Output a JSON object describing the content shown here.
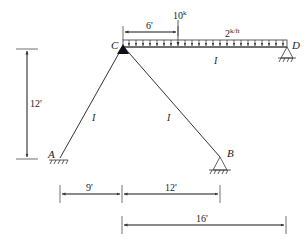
{
  "diagram": {
    "type": "structural-frame",
    "colors": {
      "line": "#333333",
      "text": "#222222",
      "background": "#ffffff"
    },
    "nodes": {
      "A": {
        "label": "A",
        "support": "fixed"
      },
      "B": {
        "label": "B",
        "support": "pin"
      },
      "C": {
        "label": "C",
        "support": "hinge"
      },
      "D": {
        "label": "D",
        "support": "pin"
      }
    },
    "members": {
      "AC": {
        "label": "I"
      },
      "BC": {
        "label": "I"
      },
      "CD": {
        "label": "I"
      }
    },
    "loads": {
      "point": {
        "label": "10",
        "unit": "k",
        "position_label": "6'"
      },
      "distributed": {
        "label": "2",
        "unit": "k/ft"
      }
    },
    "dimensions": {
      "height": "12'",
      "ac_horizontal": "9'",
      "cb_horizontal": "12'",
      "cd_horizontal": "16'",
      "load_offset": "6'"
    }
  }
}
